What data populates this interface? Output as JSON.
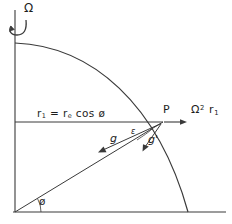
{
  "figure": {
    "stroke_color": "#3a3a3a",
    "text_color": "#1d1d1d",
    "background": "#ffffff",
    "labels": {
      "rotation_axis": "Ω",
      "radius_equation_r1": "r",
      "radius_equation_sub1": "1",
      "radius_equation_eq": " = r",
      "radius_equation_sube": "e",
      "radius_equation_cos": " cos ø",
      "point_p": "P",
      "centrifugal_omega": "Ω",
      "centrifugal_exp": "2",
      "centrifugal_r": " r",
      "centrifugal_rsub": "1",
      "gravity_g": "g",
      "gravity_g_prime": "g'",
      "angle_epsilon": "ε",
      "angle_phi": "ø"
    },
    "geometry": {
      "origin": [
        15,
        212
      ],
      "pole_top": [
        15,
        43
      ],
      "equator_right": [
        188,
        212
      ],
      "point_p": [
        163,
        122
      ],
      "r1_line_y": 122,
      "vertical_axis_x": 15,
      "baseline_y": 212,
      "baseline_x_start": 13,
      "baseline_x_end": 226,
      "axis_top_y": 10,
      "centrifugal_arrow_end": [
        186,
        122
      ],
      "g_arrow_end": [
        99,
        152
      ],
      "g_prime_arrow_end": [
        143,
        151
      ],
      "phi_arc_radius": 26,
      "spin_arrow": "curved-ccw"
    }
  }
}
